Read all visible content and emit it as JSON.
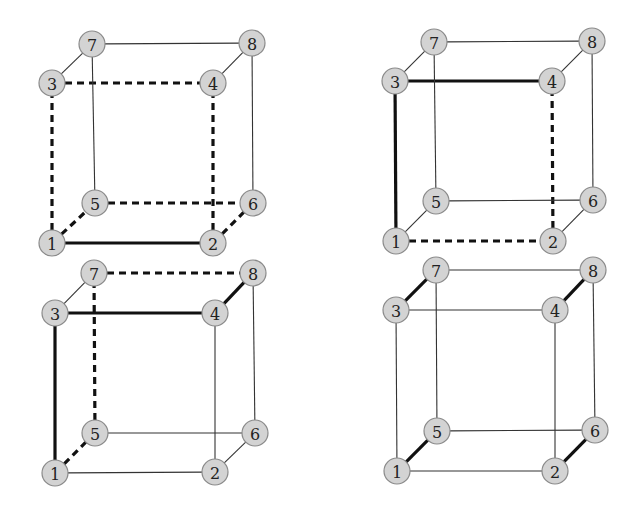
{
  "figure": {
    "node_radius": 13,
    "colors": {
      "node_fill": "#d3d3d3",
      "node_stroke": "#8a8a8a",
      "edge_thin": "#333333",
      "edge_bold": "#111111",
      "background": "#ffffff"
    },
    "cubes": [
      {
        "id": "top-left",
        "nodes": {
          "1": [
            52,
            243
          ],
          "2": [
            213,
            243
          ],
          "3": [
            52,
            83
          ],
          "4": [
            213,
            83
          ],
          "5": [
            95,
            203
          ],
          "6": [
            253,
            203
          ],
          "7": [
            92,
            44
          ],
          "8": [
            252,
            43
          ]
        },
        "edges": [
          {
            "a": "1",
            "b": "2",
            "style": "thick"
          },
          {
            "a": "3",
            "b": "4",
            "style": "dashed"
          },
          {
            "a": "1",
            "b": "3",
            "style": "dashed"
          },
          {
            "a": "2",
            "b": "4",
            "style": "dashed"
          },
          {
            "a": "1",
            "b": "5",
            "style": "dashed"
          },
          {
            "a": "5",
            "b": "6",
            "style": "dashed"
          },
          {
            "a": "2",
            "b": "6",
            "style": "dashed"
          },
          {
            "a": "7",
            "b": "8",
            "style": "thin"
          },
          {
            "a": "3",
            "b": "7",
            "style": "thin"
          },
          {
            "a": "4",
            "b": "8",
            "style": "thin"
          },
          {
            "a": "5",
            "b": "7",
            "style": "thin"
          },
          {
            "a": "6",
            "b": "8",
            "style": "thin"
          }
        ]
      },
      {
        "id": "top-right",
        "nodes": {
          "1": [
            396,
            241
          ],
          "2": [
            553,
            241
          ],
          "3": [
            395,
            81
          ],
          "4": [
            552,
            81
          ],
          "5": [
            436,
            201
          ],
          "6": [
            593,
            200
          ],
          "7": [
            434,
            42
          ],
          "8": [
            592,
            41
          ]
        },
        "edges": [
          {
            "a": "3",
            "b": "4",
            "style": "thick"
          },
          {
            "a": "1",
            "b": "3",
            "style": "thick"
          },
          {
            "a": "1",
            "b": "2",
            "style": "dashed"
          },
          {
            "a": "2",
            "b": "4",
            "style": "dashed"
          },
          {
            "a": "7",
            "b": "8",
            "style": "thin"
          },
          {
            "a": "3",
            "b": "7",
            "style": "thin"
          },
          {
            "a": "4",
            "b": "8",
            "style": "thin"
          },
          {
            "a": "5",
            "b": "7",
            "style": "thin"
          },
          {
            "a": "6",
            "b": "8",
            "style": "thin"
          },
          {
            "a": "5",
            "b": "6",
            "style": "thin"
          },
          {
            "a": "1",
            "b": "5",
            "style": "thin"
          },
          {
            "a": "2",
            "b": "6",
            "style": "thin"
          }
        ]
      },
      {
        "id": "bottom-left",
        "nodes": {
          "1": [
            55,
            473
          ],
          "2": [
            215,
            472
          ],
          "3": [
            55,
            313
          ],
          "4": [
            215,
            313
          ],
          "5": [
            95,
            433
          ],
          "6": [
            255,
            433
          ],
          "7": [
            94,
            273
          ],
          "8": [
            253,
            273
          ]
        },
        "edges": [
          {
            "a": "3",
            "b": "4",
            "style": "thick"
          },
          {
            "a": "1",
            "b": "3",
            "style": "thick"
          },
          {
            "a": "4",
            "b": "8",
            "style": "thick"
          },
          {
            "a": "7",
            "b": "8",
            "style": "dashed"
          },
          {
            "a": "5",
            "b": "7",
            "style": "dashed"
          },
          {
            "a": "1",
            "b": "5",
            "style": "dashed"
          },
          {
            "a": "3",
            "b": "7",
            "style": "thin"
          },
          {
            "a": "6",
            "b": "8",
            "style": "thin"
          },
          {
            "a": "2",
            "b": "4",
            "style": "thin"
          },
          {
            "a": "5",
            "b": "6",
            "style": "thin"
          },
          {
            "a": "1",
            "b": "2",
            "style": "thin"
          },
          {
            "a": "2",
            "b": "6",
            "style": "thin"
          }
        ]
      },
      {
        "id": "bottom-right",
        "nodes": {
          "1": [
            397,
            471
          ],
          "2": [
            555,
            471
          ],
          "3": [
            396,
            310
          ],
          "4": [
            555,
            310
          ],
          "5": [
            437,
            431
          ],
          "6": [
            595,
            430
          ],
          "7": [
            436,
            270
          ],
          "8": [
            593,
            270
          ]
        },
        "edges": [
          {
            "a": "3",
            "b": "7",
            "style": "thick"
          },
          {
            "a": "4",
            "b": "8",
            "style": "thick"
          },
          {
            "a": "1",
            "b": "5",
            "style": "thick"
          },
          {
            "a": "2",
            "b": "6",
            "style": "thick"
          },
          {
            "a": "7",
            "b": "8",
            "style": "thin"
          },
          {
            "a": "3",
            "b": "4",
            "style": "thin"
          },
          {
            "a": "1",
            "b": "3",
            "style": "thin"
          },
          {
            "a": "2",
            "b": "4",
            "style": "thin"
          },
          {
            "a": "5",
            "b": "7",
            "style": "thin"
          },
          {
            "a": "6",
            "b": "8",
            "style": "thin"
          },
          {
            "a": "5",
            "b": "6",
            "style": "thin"
          },
          {
            "a": "1",
            "b": "2",
            "style": "thin"
          }
        ]
      }
    ]
  }
}
